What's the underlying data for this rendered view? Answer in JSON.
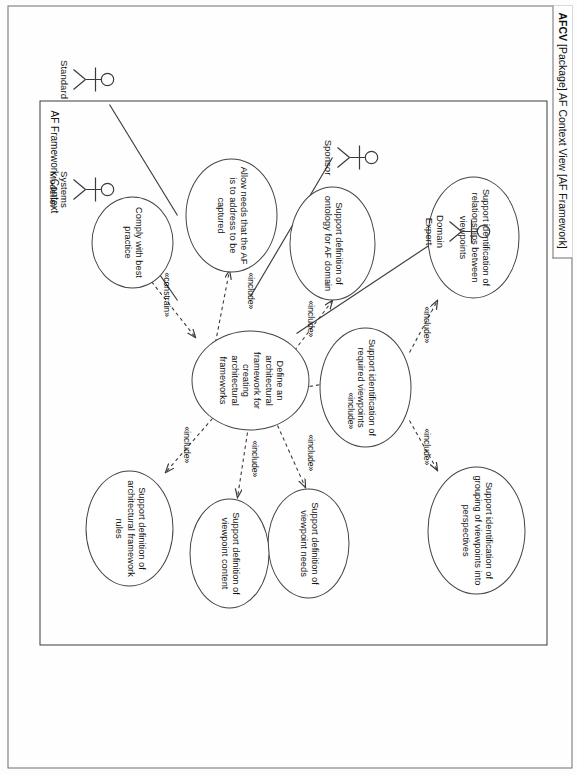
{
  "window": {
    "title_id": "AFCV",
    "title_rest": " [Package] AF Context View [AF Framework]"
  },
  "boundary": {
    "label": "AF Framework Context"
  },
  "use_cases": [
    {
      "id": "uc-relationships",
      "label": "Support identification of relationships between viewpoints"
    },
    {
      "id": "uc-grouping",
      "label": "Support identification of grouping of viewpoints into perspectives"
    },
    {
      "id": "uc-required-vp",
      "label": "Support identification of required viewpoints"
    },
    {
      "id": "uc-ontology",
      "label": "Support definition of ontology for AF domain"
    },
    {
      "id": "uc-central",
      "label": "Define an architectural framework for creating architectural frameworks"
    },
    {
      "id": "uc-vp-needs",
      "label": "Support definition of viewpoint needs"
    },
    {
      "id": "uc-vp-content",
      "label": "Support definition of viewpoint content"
    },
    {
      "id": "uc-af-rules",
      "label": "Support definition of architectural framework rules"
    },
    {
      "id": "uc-needs",
      "label": "Allow needs that the AF is to address to be captured"
    },
    {
      "id": "uc-best-practice",
      "label": "Comply with best practice"
    }
  ],
  "actors": [
    {
      "id": "actor-domain-expert",
      "label": "Domain Expert"
    },
    {
      "id": "actor-sponsor",
      "label": "Sponsor"
    },
    {
      "id": "actor-standard",
      "label": "Standard"
    },
    {
      "id": "actor-systems-modeller",
      "label": "Systems\nModeller"
    }
  ],
  "stereotypes": {
    "include": "«include»",
    "constrain": "«constrain»"
  },
  "relationship_labels": [
    {
      "id": "rel-1",
      "text": "«include»"
    },
    {
      "id": "rel-2",
      "text": "«include»"
    },
    {
      "id": "rel-3",
      "text": "«include»"
    },
    {
      "id": "rel-4",
      "text": "«include»"
    },
    {
      "id": "rel-5",
      "text": "«include»"
    },
    {
      "id": "rel-6",
      "text": "«include»"
    },
    {
      "id": "rel-7",
      "text": "«include»"
    },
    {
      "id": "rel-8",
      "text": "«include»"
    },
    {
      "id": "rel-9",
      "text": "«constrain»"
    }
  ],
  "colors": {
    "line": "#3b3b3b",
    "frame": "#6f6f6f",
    "background": "#fdfdfd"
  }
}
